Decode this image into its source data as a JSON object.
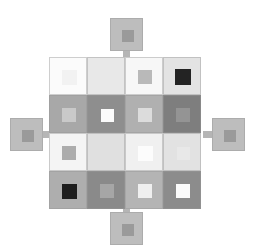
{
  "figure": {
    "type": "diagram",
    "canvas": {
      "width": 257,
      "height": 250,
      "background": "#ffffff"
    },
    "grid": {
      "rows": 4,
      "cols": 4,
      "origin_x": 49,
      "origin_y": 57,
      "tile_size": 38,
      "pitch": 38,
      "gap": 0
    },
    "tiles": [
      {
        "row": 0,
        "col": 0,
        "name": "tile-r1c1",
        "fill": "#fbfbfb",
        "inner": "#f2f2f2",
        "inner_ratio": 0.4
      },
      {
        "row": 0,
        "col": 1,
        "name": "tile-r1c2",
        "fill": "#e8e8e8",
        "inner": "#e8e8e8",
        "inner_ratio": 0.0
      },
      {
        "row": 0,
        "col": 2,
        "name": "tile-r1c3",
        "fill": "#f7f7f7",
        "inner": "#b9b9b9",
        "inner_ratio": 0.38
      },
      {
        "row": 0,
        "col": 3,
        "name": "tile-r1c4",
        "fill": "#e3e3e3",
        "inner": "#232323",
        "inner_ratio": 0.42
      },
      {
        "row": 1,
        "col": 0,
        "name": "tile-r2c1",
        "fill": "#a8a8a8",
        "inner": "#c9c9c9",
        "inner_ratio": 0.36
      },
      {
        "row": 1,
        "col": 1,
        "name": "tile-r2c2",
        "fill": "#8e8e8e",
        "inner": "#fbfbfb",
        "inner_ratio": 0.34
      },
      {
        "row": 1,
        "col": 2,
        "name": "tile-r2c3",
        "fill": "#b0b0b0",
        "inner": "#dcdcdc",
        "inner_ratio": 0.36
      },
      {
        "row": 1,
        "col": 3,
        "name": "tile-r2c4",
        "fill": "#7e7e7e",
        "inner": "#949494",
        "inner_ratio": 0.38
      },
      {
        "row": 2,
        "col": 0,
        "name": "tile-r3c1",
        "fill": "#f4f4f4",
        "inner": "#acacac",
        "inner_ratio": 0.36
      },
      {
        "row": 2,
        "col": 1,
        "name": "tile-r3c2",
        "fill": "#e0e0e0",
        "inner": "#e0e0e0",
        "inner_ratio": 0.0
      },
      {
        "row": 2,
        "col": 2,
        "name": "tile-r3c3",
        "fill": "#f0f0f0",
        "inner": "#fcfcfc",
        "inner_ratio": 0.4
      },
      {
        "row": 2,
        "col": 3,
        "name": "tile-r3c4",
        "fill": "#e2e2e2",
        "inner": "#e8e8e8",
        "inner_ratio": 0.34
      },
      {
        "row": 3,
        "col": 0,
        "name": "tile-r4c1",
        "fill": "#aeaeae",
        "inner": "#1e1e1e",
        "inner_ratio": 0.4
      },
      {
        "row": 3,
        "col": 1,
        "name": "tile-r4c2",
        "fill": "#8a8a8a",
        "inner": "#a6a6a6",
        "inner_ratio": 0.38
      },
      {
        "row": 3,
        "col": 2,
        "name": "tile-r4c3",
        "fill": "#b4b4b4",
        "inner": "#efefef",
        "inner_ratio": 0.38
      },
      {
        "row": 3,
        "col": 3,
        "name": "tile-r4c4",
        "fill": "#8c8c8c",
        "inner": "#fbfbfb",
        "inner_ratio": 0.38
      }
    ],
    "satellites": [
      {
        "name": "satellite-top",
        "x": 110,
        "y": 18,
        "size": 33,
        "fill": "#bdbdbd",
        "inner": "#9a9a9a",
        "inner_ratio": 0.36
      },
      {
        "name": "satellite-left",
        "x": 10,
        "y": 118,
        "size": 33,
        "fill": "#bdbdbd",
        "inner": "#9a9a9a",
        "inner_ratio": 0.36
      },
      {
        "name": "satellite-right",
        "x": 212,
        "y": 118,
        "size": 33,
        "fill": "#bdbdbd",
        "inner": "#9a9a9a",
        "inner_ratio": 0.36
      },
      {
        "name": "satellite-bottom",
        "x": 110,
        "y": 212,
        "size": 33,
        "fill": "#bdbdbd",
        "inner": "#9a9a9a",
        "inner_ratio": 0.36
      }
    ],
    "stubs": [
      {
        "name": "stub-top",
        "x": 123,
        "y": 51,
        "w": 7,
        "h": 8,
        "fill": "#b5b5b5"
      },
      {
        "name": "stub-left",
        "x": 43,
        "y": 131,
        "w": 8,
        "h": 7,
        "fill": "#b5b5b5"
      },
      {
        "name": "stub-right",
        "x": 203,
        "y": 131,
        "w": 9,
        "h": 7,
        "fill": "#b5b5b5"
      },
      {
        "name": "stub-bottom",
        "x": 123,
        "y": 204,
        "w": 7,
        "h": 8,
        "fill": "#b5b5b5"
      }
    ],
    "connectors": {
      "note": "Small square/bar links sitting at tile seams. h = horizontal link between columns, v = vertical link between rows.",
      "items": [
        {
          "name": "conn-h-r1-c1c2",
          "x": 81,
          "y": 64,
          "w": 12,
          "h": 11,
          "fill": "#262626"
        },
        {
          "name": "conn-h-r1-c2c3",
          "x": 119,
          "y": 64,
          "w": 12,
          "h": 11,
          "fill": "#2b2b2b"
        },
        {
          "name": "conn-h-r1-c3c4",
          "x": 157,
          "y": 64,
          "w": 12,
          "h": 11,
          "fill": "#262626"
        },
        {
          "name": "conn-h-r2-c1c2",
          "x": 81,
          "y": 104,
          "w": 12,
          "h": 11,
          "fill": "#9b9b9b"
        },
        {
          "name": "conn-h-r2-c2c3",
          "x": 119,
          "y": 104,
          "w": 12,
          "h": 11,
          "fill": "#9e9e9e"
        },
        {
          "name": "conn-h-r2-c3c4",
          "x": 157,
          "y": 104,
          "w": 12,
          "h": 11,
          "fill": "#9b9b9b"
        },
        {
          "name": "conn-h-r3-c1c2",
          "x": 81,
          "y": 142,
          "w": 12,
          "h": 11,
          "fill": "#b6b6b6"
        },
        {
          "name": "conn-h-r3-c2c3",
          "x": 119,
          "y": 142,
          "w": 12,
          "h": 11,
          "fill": "#a4a4a4"
        },
        {
          "name": "conn-h-r3-c3c4",
          "x": 157,
          "y": 142,
          "w": 12,
          "h": 11,
          "fill": "#bdbdbd"
        },
        {
          "name": "conn-h-r4-c1c2",
          "x": 81,
          "y": 181,
          "w": 12,
          "h": 11,
          "fill": "#1f1f1f"
        },
        {
          "name": "conn-h-r4-c2c3",
          "x": 119,
          "y": 181,
          "w": 12,
          "h": 11,
          "fill": "#1f1f1f"
        },
        {
          "name": "conn-h-r4-c3c4",
          "x": 157,
          "y": 181,
          "w": 12,
          "h": 11,
          "fill": "#1f1f1f"
        },
        {
          "name": "conn-v-c1-r1r2",
          "x": 62,
          "y": 90,
          "w": 11,
          "h": 12,
          "fill": "#242424"
        },
        {
          "name": "conn-v-c2-r1r2",
          "x": 100,
          "y": 90,
          "w": 11,
          "h": 12,
          "fill": "#dddddd"
        },
        {
          "name": "conn-v-c3-r1r2",
          "x": 138,
          "y": 90,
          "w": 11,
          "h": 12,
          "fill": "#c2c2c2"
        },
        {
          "name": "conn-v-c4-r1r2",
          "x": 176,
          "y": 90,
          "w": 11,
          "h": 12,
          "fill": "#242424"
        },
        {
          "name": "conn-v-c1-r2r3",
          "x": 62,
          "y": 128,
          "w": 11,
          "h": 12,
          "fill": "#242424"
        },
        {
          "name": "conn-v-c2-r2r3",
          "x": 100,
          "y": 128,
          "w": 11,
          "h": 12,
          "fill": "#cfcfcf"
        },
        {
          "name": "conn-v-c3-r2r3",
          "x": 138,
          "y": 128,
          "w": 11,
          "h": 12,
          "fill": "#a3a3a3"
        },
        {
          "name": "conn-v-c4-r2r3",
          "x": 176,
          "y": 128,
          "w": 11,
          "h": 12,
          "fill": "#242424"
        },
        {
          "name": "conn-v-c1-r3r4",
          "x": 62,
          "y": 167,
          "w": 11,
          "h": 12,
          "fill": "#262626"
        },
        {
          "name": "conn-v-c2-r3r4",
          "x": 100,
          "y": 167,
          "w": 11,
          "h": 12,
          "fill": "#dcdcdc"
        },
        {
          "name": "conn-v-c3-r3r4",
          "x": 138,
          "y": 167,
          "w": 11,
          "h": 12,
          "fill": "#b2b2b2"
        },
        {
          "name": "conn-v-c4-r3r4",
          "x": 176,
          "y": 167,
          "w": 11,
          "h": 12,
          "fill": "#1d1d1d"
        }
      ]
    }
  }
}
